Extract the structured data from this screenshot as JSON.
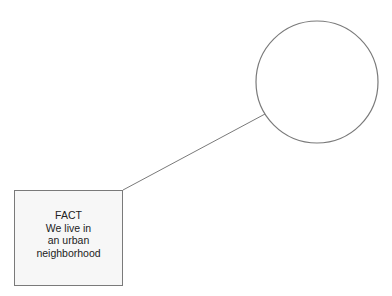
{
  "diagram": {
    "fact_box": {
      "lines": [
        "FACT",
        "We live in",
        "an urban",
        "neighborhood"
      ]
    },
    "circle": {
      "label": ""
    },
    "colors": {
      "stroke": "#7a7a7a",
      "box_fill": "#f7f7f7",
      "background": "#ffffff"
    }
  }
}
